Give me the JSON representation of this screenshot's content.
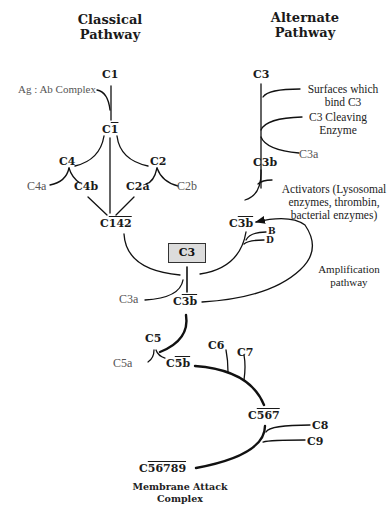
{
  "titles": {
    "classical": "Classical\nPathway",
    "classical_line1": "Classical",
    "classical_line2": "Pathway",
    "alternate_line1": "Alternate",
    "alternate_line2": "Pathway"
  },
  "classical": {
    "c1": "C1",
    "ag_ab": "Ag : Ab Complex",
    "c1_active_prefix": "C",
    "c1_active_bar": "1",
    "c4": "C4",
    "c2": "C2",
    "c4a": "C4a",
    "c4b": "C4b",
    "c2a": "C2a",
    "c2b": "C2b",
    "c142_prefix": "C",
    "c142_bar": "142"
  },
  "alternate": {
    "c3": "C3",
    "surfaces": "Surfaces which\nbind C3",
    "surfaces_line1": "Surfaces which",
    "surfaces_line2": "bind C3",
    "cleaving_line1": "C3 Cleaving",
    "cleaving_line2": "Enzyme",
    "c3b": "C3b",
    "c3a": "C3a",
    "activators_line1": "Activators (Lysosomal",
    "activators_line2": "enzymes, thrombin,",
    "activators_line3": "bacterial enzymes)",
    "c3b_active_prefix": "C",
    "c3b_active_bar": "3b",
    "factor_b": "B",
    "factor_d": "D"
  },
  "central": {
    "c3_box": "C3",
    "c3a": "C3a",
    "c3b_prefix": "C",
    "c3b_bar": "3b",
    "amplification_line1": "Amplification",
    "amplification_line2": "pathway"
  },
  "terminal": {
    "c5": "C5",
    "c5a": "C5a",
    "c5b_prefix": "C",
    "c5b_bar": "5b",
    "c6": "C6",
    "c7": "C7",
    "c567_prefix": "C",
    "c567_bar": "567",
    "c8": "C8",
    "c9": "C9",
    "c56789_prefix": "C",
    "c56789_bar": "56789",
    "mac_line1": "Membrane Attack",
    "mac_line2": "Complex"
  },
  "colors": {
    "line": "#111111",
    "c3_box_fill": "#dcdcdc",
    "secondary_text": "#555555"
  }
}
